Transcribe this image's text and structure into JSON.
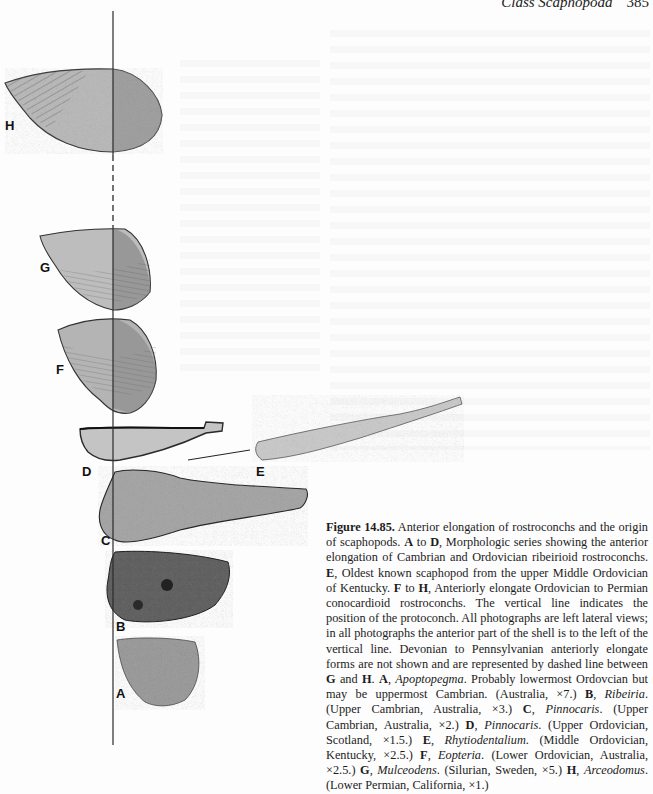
{
  "running_head": {
    "title": "Class Scaphopoda",
    "page": "385"
  },
  "figure": {
    "panel_labels": [
      "H",
      "G",
      "F",
      "D",
      "E",
      "C",
      "B",
      "A"
    ],
    "caption": {
      "number": "Figure 14.85.",
      "intro": " Anterior elongation of rostroconchs and the origin of scaphopods. ",
      "s1_label": "A",
      "s1_to": " to ",
      "s1_label2": "D",
      "s1_text": ", Morphologic series showing the anterior elongation of Cambrian and Ordovician ribeirioid rostroconchs. ",
      "s2_label": "E",
      "s2_text": ", Oldest known scaphopod from the upper Middle Ordovician of Kentucky. ",
      "s3_label": "F",
      "s3_to": " to ",
      "s3_label2": "H",
      "s3_text": ", Anteriorly elongate Ordovician to Permian conocardioid rostroconchs. The vertical line indicates the position of the protoconch. All photographs are left lateral views; in all photographs the anterior part of the shell is to the left of the vertical line. Devonian to Pennsylvanian anteriorly elongate forms are not shown and are represented by dashed line between ",
      "s3_g": "G",
      "s3_and": " and ",
      "s3_h": "H",
      "s3_end": ". ",
      "taxa": [
        {
          "label": "A",
          "name": "Apoptopegma",
          "detail": ". Probably lowermost Ordovcian but may be uppermost Cambrian. (Australia, ×7.) "
        },
        {
          "label": "B",
          "name": "Ribeiria",
          "detail": ". (Upper Cambrian, Australia, ×3.) "
        },
        {
          "label": "C",
          "name": "Pinnocaris",
          "detail": ". (Upper Cambrian, Australia, ×2.) "
        },
        {
          "label": "D",
          "name": "Pinnocaris",
          "detail": ". (Upper Ordovician, Scotland, ×1.5.) "
        },
        {
          "label": "E",
          "name": "Rhytiodentalium",
          "detail": ". (Middle Ordovician, Kentucky, ×2.5.) "
        },
        {
          "label": "F",
          "name": "Eopteria",
          "detail": ". (Lower Ordovician, Australia, ×2.5.) "
        },
        {
          "label": "G",
          "name": "Mulceodens",
          "detail": ". (Silurian, Sweden, ×5.) "
        },
        {
          "label": "H",
          "name": "Arceodomus",
          "detail": ". (Lower Permian, California, ×1.)"
        }
      ]
    }
  }
}
